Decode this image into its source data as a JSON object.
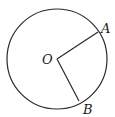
{
  "diagram": {
    "type": "circle-with-radii",
    "circle": {
      "cx": 57,
      "cy": 59,
      "r": 50,
      "stroke": "#2a2a2a"
    },
    "center": {
      "label": "O",
      "x": 57,
      "y": 59
    },
    "points": [
      {
        "label": "A",
        "x": 98,
        "y": 32
      },
      {
        "label": "B",
        "x": 79,
        "y": 101
      }
    ],
    "segments": [
      {
        "from": "O",
        "to": "A"
      },
      {
        "from": "O",
        "to": "B"
      }
    ]
  }
}
